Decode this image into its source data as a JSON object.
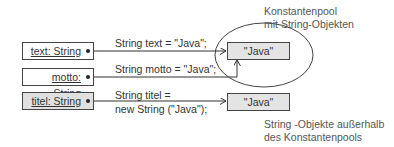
{
  "diagram": {
    "variables": [
      {
        "label": "text: String",
        "fill": "white"
      },
      {
        "label": "motto: String",
        "fill": "white"
      },
      {
        "label": "titel: String",
        "fill": "grey"
      }
    ],
    "code": {
      "text_decl": "String text = \"Java\";",
      "motto_decl": "String motto = \"Java\";",
      "titel_decl_line1": "String titel =",
      "titel_decl_line2": "new String (\"Java\");"
    },
    "objects": {
      "pool_object": "\"Java\"",
      "heap_object": "\"Java\""
    },
    "notes": {
      "pool_line1": "Konstantenpool",
      "pool_line2": "mit String-Objekten",
      "heap_line1": "String -Objekte außerhalb",
      "heap_line2": "des Konstantenpools"
    },
    "colors": {
      "line": "#333333",
      "object_fill": "#e4e4e4",
      "grey_var_fill": "#e0e0e0"
    }
  }
}
